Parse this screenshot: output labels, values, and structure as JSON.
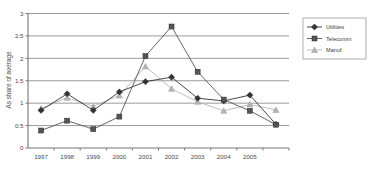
{
  "chart_data": {
    "type": "line",
    "title": "",
    "subtitle": "",
    "xlabel": "",
    "ylabel": "As share of average",
    "ylim": [
      0,
      3
    ],
    "ytick_labels": [
      "0",
      "0.5",
      "1",
      "1.5",
      "2",
      "2.5",
      "3"
    ],
    "ytick_values": [
      0,
      0.5,
      1,
      1.5,
      2,
      2.5,
      3
    ],
    "grid": "horizontal",
    "legend_position": "right",
    "categories": [
      "1997",
      "1998",
      "1999",
      "2000",
      "2001",
      "2002",
      "2003",
      "2004",
      "2005",
      ""
    ],
    "xtick_labels": [
      "1997",
      "1998",
      "1999",
      "2000",
      "2001",
      "2002",
      "2003",
      "2004",
      "2005",
      ""
    ],
    "series": [
      {
        "name": "Utilities",
        "color": "#333333",
        "marker": "diamond",
        "values": [
          0.84,
          1.21,
          0.84,
          1.25,
          1.48,
          1.58,
          1.11,
          1.05,
          1.18,
          0.53
        ]
      },
      {
        "name": "Telecomm",
        "color": "#555555",
        "marker": "square",
        "values": [
          0.39,
          0.61,
          0.42,
          0.7,
          2.05,
          2.71,
          1.7,
          1.08,
          0.83,
          0.52
        ]
      },
      {
        "name": "Manuf",
        "color": "#b5b5b5",
        "marker": "triangle",
        "values": [
          0.88,
          1.12,
          0.93,
          1.17,
          1.82,
          1.32,
          1.03,
          0.83,
          0.97,
          0.85
        ]
      }
    ]
  },
  "legend": {
    "entries": [
      {
        "label": "Utilities"
      },
      {
        "label": "Telecomm"
      },
      {
        "label": "Manuf"
      }
    ]
  },
  "axis": {
    "y_title": "As share of average"
  }
}
